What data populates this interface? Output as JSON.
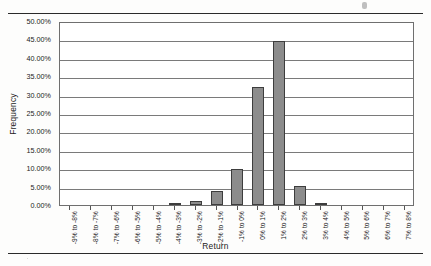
{
  "page": {
    "has_top_rule": true,
    "has_bottom_rule": true
  },
  "chart_data": {
    "type": "bar",
    "title": "",
    "subtitle": "",
    "xlabel": "Return",
    "ylabel": "Frequency",
    "ylim": [
      0,
      50
    ],
    "ytick_labels": [
      "50.00%",
      "45.00%",
      "40.00%",
      "35.00%",
      "30.00%",
      "25.00%",
      "20.00%",
      "15.00%",
      "10.00%",
      "5.00%",
      "0.00%"
    ],
    "ytick_values": [
      50,
      45,
      40,
      35,
      30,
      25,
      20,
      15,
      10,
      5,
      0
    ],
    "grid": true,
    "legend": "none",
    "value_unit": "%",
    "categories": [
      "-9% to -8%",
      "-8% to -7%",
      "-7% to -6%",
      "-6% to -5%",
      "-5% to -4%",
      "-4% to -3%",
      "-3% to -2%",
      "-2% to -1%",
      "-1% to 0%",
      "0% to 1%",
      "1% to 2%",
      "2% to 3%",
      "3% to 4%",
      "4% to 5%",
      "5% to 6%",
      "6% to 7%",
      "7% to 8%"
    ],
    "values": [
      0,
      0,
      0,
      0,
      0,
      0.3,
      1.2,
      3.8,
      9.8,
      32.0,
      44.7,
      5.2,
      0.3,
      0,
      0,
      0,
      0
    ],
    "bar_color": "#8c8c8c",
    "bar_edge_color": "#3d3d3d",
    "axis_color": "#6f6f6f",
    "grid_color": "#7a7a7a"
  }
}
